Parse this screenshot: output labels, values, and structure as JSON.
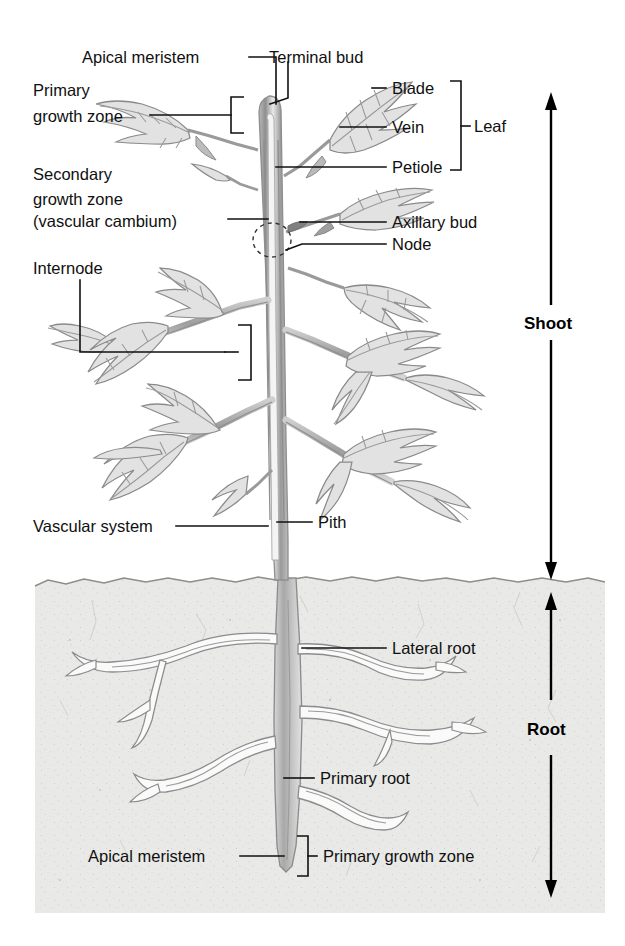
{
  "diagram": {
    "labels": {
      "apical_meristem_top": "Apical meristem",
      "terminal_bud": "Terminal bud",
      "primary_growth_zone_l1": "Primary",
      "primary_growth_zone_l2": "growth zone",
      "secondary_growth_zone_l1": "Secondary",
      "secondary_growth_zone_l2": "growth zone",
      "secondary_growth_zone_l3": "(vascular cambium)",
      "internode": "Internode",
      "blade": "Blade",
      "vein": "Vein",
      "petiole": "Petiole",
      "leaf": "Leaf",
      "axillary_bud": "Axillary bud",
      "node": "Node",
      "vascular_system": "Vascular system",
      "pith": "Pith",
      "lateral_root": "Lateral root",
      "primary_root": "Primary root",
      "apical_meristem_bottom": "Apical meristem",
      "primary_growth_zone_root": "Primary growth zone",
      "shoot": "Shoot",
      "root": "Root"
    },
    "colors": {
      "ink": "#101010",
      "leader": "#111111",
      "soil_fill": "#e8e8e6",
      "soil_edge": "#8c8c8c",
      "leaf_fill": "#e2e2e2",
      "leaf_outline": "#8a8a8a",
      "stem_outline": "#8e8e8e",
      "background": "#ffffff"
    },
    "regions": {
      "shoot_label": "Shoot",
      "root_label": "Root",
      "soil_top_y": 578,
      "soil_bottom_y": 913
    }
  }
}
